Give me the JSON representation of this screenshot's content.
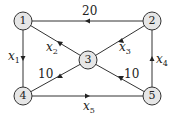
{
  "diagram": {
    "type": "directed-graph",
    "nodes": [
      {
        "id": "1",
        "label": "1",
        "x": 23,
        "y": 21
      },
      {
        "id": "2",
        "label": "2",
        "x": 152,
        "y": 21
      },
      {
        "id": "3",
        "label": "3",
        "x": 88,
        "y": 60
      },
      {
        "id": "4",
        "label": "4",
        "x": 23,
        "y": 96
      },
      {
        "id": "5",
        "label": "5",
        "x": 152,
        "y": 96
      }
    ],
    "edges": [
      {
        "from": "2",
        "to": "1",
        "label": "20"
      },
      {
        "from": "3",
        "to": "1",
        "label": "x2",
        "var": "x",
        "sub": "2"
      },
      {
        "from": "2",
        "to": "3",
        "label": "x3",
        "var": "x",
        "sub": "3"
      },
      {
        "from": "1",
        "to": "4",
        "label": "x1",
        "var": "x",
        "sub": "1"
      },
      {
        "from": "5",
        "to": "2",
        "label": "x4",
        "var": "x",
        "sub": "4"
      },
      {
        "from": "3",
        "to": "4",
        "label": "10"
      },
      {
        "from": "5",
        "to": "3",
        "label": "10"
      },
      {
        "from": "4",
        "to": "5",
        "label": "x5",
        "var": "x",
        "sub": "5"
      }
    ],
    "colors": {
      "node_fill": "#e6e6e6",
      "stroke": "#333333"
    }
  }
}
